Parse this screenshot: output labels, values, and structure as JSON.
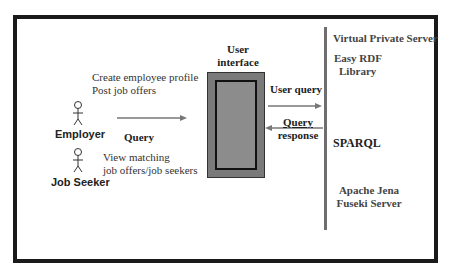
{
  "diagram": {
    "actors": [
      {
        "id": "employer",
        "label": "Employer",
        "icon": "stick-figure-icon"
      },
      {
        "id": "job_seeker",
        "label": "Job Seeker",
        "icon": "stick-figure-icon"
      }
    ],
    "employer_actions": {
      "line1": "Create employee profile",
      "line2": "Post job offers"
    },
    "job_seeker_actions": {
      "line1": "View matching",
      "line2": "job offers/job seekers"
    },
    "query_label": "Query",
    "user_interface": {
      "line1": "User",
      "line2": "interface"
    },
    "user_query_label": "User query",
    "query_response": {
      "line1": "Query",
      "line2": "response"
    },
    "server": {
      "title": "Virtual Private Server",
      "easy_rdf": {
        "line1": "Easy RDF",
        "line2": "Library"
      },
      "sparql": "SPARQL",
      "fuseki": {
        "line1": "Apache Jena",
        "line2": "Fuseki Server"
      }
    },
    "colors": {
      "frame": "#1a1a1a",
      "ui_outer": "#7a7a7a",
      "ui_inner": "#8c8c8c",
      "arrow": "#777777",
      "divider": "#6e6e6e"
    }
  }
}
